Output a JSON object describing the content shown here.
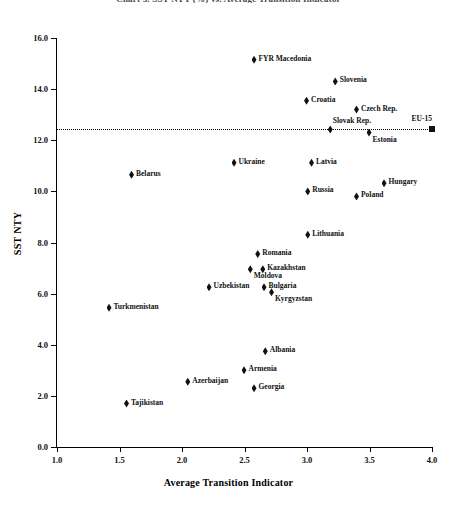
{
  "chart_data": {
    "type": "scatter",
    "title": "Chart 3. SST NTY (%) vs. Average Transition Indicator",
    "xlabel": "Average Transition Indicator",
    "ylabel": "SST NTY",
    "xlim": [
      1.0,
      4.0
    ],
    "ylim": [
      0.0,
      16.0
    ],
    "xticks": [
      "1.0",
      "1.5",
      "2.0",
      "2.5",
      "3.0",
      "3.5",
      "4.0"
    ],
    "xtick_values": [
      1.0,
      1.5,
      2.0,
      2.5,
      3.0,
      3.5,
      4.0
    ],
    "yticks": [
      "0.0",
      "2.0",
      "4.0",
      "6.0",
      "8.0",
      "10.0",
      "12.0",
      "14.0",
      "16.0"
    ],
    "ytick_values": [
      0.0,
      2.0,
      4.0,
      6.0,
      8.0,
      10.0,
      12.0,
      14.0,
      16.0
    ],
    "grid": false,
    "legend": false,
    "marker_color": "#111111",
    "reference_line": {
      "label": "EU-15",
      "y": 12.45,
      "style": "dotted",
      "color": "#000000",
      "endpoint_x": 4.0,
      "endpoint_marker": "square"
    },
    "points": [
      {
        "label": "FYR Macedonia",
        "x": 2.58,
        "y": 15.15,
        "label_pos": "right"
      },
      {
        "label": "Slovenia",
        "x": 3.23,
        "y": 14.3,
        "label_pos": "right"
      },
      {
        "label": "Croatia",
        "x": 3.0,
        "y": 13.55,
        "label_pos": "right"
      },
      {
        "label": "Czech Rep.",
        "x": 3.4,
        "y": 13.2,
        "label_pos": "right"
      },
      {
        "label": "Slovak Rep.",
        "x": 3.19,
        "y": 12.42,
        "label_pos": "above"
      },
      {
        "label": "Estonia",
        "x": 3.5,
        "y": 12.3,
        "label_pos": "below"
      },
      {
        "label": "EU-15",
        "x": 4.0,
        "y": 12.45,
        "label_pos": "abover",
        "marker": "square"
      },
      {
        "label": "Ukraine",
        "x": 2.42,
        "y": 11.12,
        "label_pos": "right"
      },
      {
        "label": "Latvia",
        "x": 3.04,
        "y": 11.12,
        "label_pos": "right"
      },
      {
        "label": "Belarus",
        "x": 1.6,
        "y": 10.65,
        "label_pos": "right"
      },
      {
        "label": "Hungary",
        "x": 3.62,
        "y": 10.32,
        "label_pos": "right"
      },
      {
        "label": "Russia",
        "x": 3.01,
        "y": 10.0,
        "label_pos": "right"
      },
      {
        "label": "Poland",
        "x": 3.4,
        "y": 9.8,
        "label_pos": "right"
      },
      {
        "label": "Lithuania",
        "x": 3.01,
        "y": 8.3,
        "label_pos": "right"
      },
      {
        "label": "Romania",
        "x": 2.61,
        "y": 7.55,
        "label_pos": "right"
      },
      {
        "label": "Kazakhstan",
        "x": 2.65,
        "y": 6.95,
        "label_pos": "right"
      },
      {
        "label": "Moldova",
        "x": 2.55,
        "y": 6.95,
        "label_pos": "below"
      },
      {
        "label": "Uzbekistan",
        "x": 2.22,
        "y": 6.25,
        "label_pos": "right"
      },
      {
        "label": "Bulgaria",
        "x": 2.66,
        "y": 6.25,
        "label_pos": "right"
      },
      {
        "label": "Kyrgyzstan",
        "x": 2.72,
        "y": 6.05,
        "label_pos": "below"
      },
      {
        "label": "Turkmenistan",
        "x": 1.42,
        "y": 5.45,
        "label_pos": "right"
      },
      {
        "label": "Albania",
        "x": 2.67,
        "y": 3.75,
        "label_pos": "right"
      },
      {
        "label": "Armenia",
        "x": 2.5,
        "y": 3.0,
        "label_pos": "right"
      },
      {
        "label": "Azerbaijan",
        "x": 2.05,
        "y": 2.55,
        "label_pos": "right"
      },
      {
        "label": "Georgia",
        "x": 2.58,
        "y": 2.3,
        "label_pos": "right"
      },
      {
        "label": "Tajikistan",
        "x": 1.56,
        "y": 1.7,
        "label_pos": "right"
      }
    ]
  }
}
